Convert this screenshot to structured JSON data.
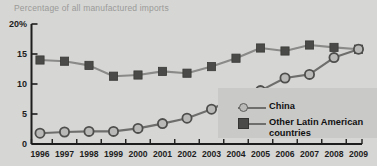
{
  "chart_data": {
    "type": "line",
    "title": "Percentage of all manufactured imports",
    "xlabel": "",
    "ylabel": "",
    "ylim": [
      0,
      20
    ],
    "yticks": [
      "0",
      "5",
      "10",
      "15",
      "20%"
    ],
    "ytick_values": [
      0,
      5,
      10,
      15,
      20
    ],
    "grid": false,
    "legend_position": "inside-right",
    "categories": [
      "1996",
      "1997",
      "1998",
      "1999",
      "2000",
      "2001",
      "2002",
      "2003",
      "2004",
      "2005",
      "2006",
      "2007",
      "2008",
      "2009"
    ],
    "series": [
      {
        "name": "China",
        "marker": "circle",
        "color": "#b9b9b7",
        "line_color": "#6e6e6c",
        "values": [
          1.8,
          2.0,
          2.1,
          2.1,
          2.6,
          3.4,
          4.3,
          5.8,
          7.8,
          8.9,
          11.0,
          11.6,
          14.4,
          15.8
        ]
      },
      {
        "name": "Other Latin American countries",
        "marker": "square",
        "color": "#4a4a48",
        "line_color": "#8a8a88",
        "values": [
          14.0,
          13.8,
          13.1,
          11.3,
          11.5,
          12.1,
          11.8,
          12.9,
          14.3,
          16.0,
          15.5,
          16.5,
          16.1,
          15.8
        ]
      }
    ]
  },
  "legend": {
    "items": [
      {
        "label": "China",
        "marker": "circle"
      },
      {
        "label": "Other Latin American\ncountries",
        "marker": "square"
      }
    ]
  },
  "colors": {
    "background": "#d6d6d4",
    "legend_panel": "#c9c9c7",
    "axis": "#1d1d1d",
    "title_text": "#9a9a98",
    "china_fill": "#b9b9b7",
    "china_line": "#6e6e6c",
    "latam_fill": "#4a4a48",
    "latam_line": "#8a8a88"
  }
}
